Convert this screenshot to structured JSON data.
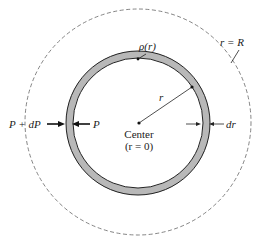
{
  "diagram": {
    "labels": {
      "density": "ρ(r)",
      "outer_boundary": "r = R",
      "radius": "r",
      "pressure_outer": "P + dP",
      "pressure_inner": "P",
      "thickness": "dr",
      "center": "Center",
      "center_coord": "(r = 0)"
    },
    "colors": {
      "shell_fill": "#b8b8b8",
      "stroke": "#222222",
      "dashed_circle": "#555555"
    }
  }
}
